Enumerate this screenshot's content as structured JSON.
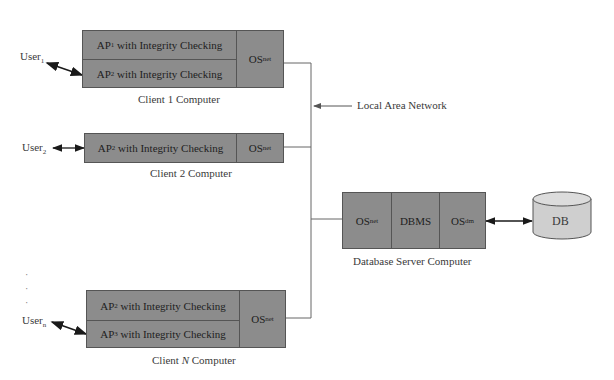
{
  "diagram": {
    "clients": [
      {
        "label": "Client 1 Computer",
        "user": {
          "base": "User",
          "sub": "1"
        },
        "apps": [
          {
            "base": "AP",
            "sub": "1",
            "text": " with Integrity Checking"
          },
          {
            "base": "AP",
            "sub": "2",
            "text": " with Integrity Checking"
          }
        ],
        "os": {
          "base": "OS",
          "sub": "net"
        }
      },
      {
        "label": "Client 2 Computer",
        "user": {
          "base": "User",
          "sub": "2"
        },
        "apps": [
          {
            "base": "AP",
            "sub": "2",
            "text": " with Integrity Checking"
          }
        ],
        "os": {
          "base": "OS",
          "sub": "net"
        }
      },
      {
        "label_prefix": "Client ",
        "label_italic": "N",
        "label_suffix": " Computer",
        "user": {
          "base": "User",
          "sub": "n"
        },
        "apps": [
          {
            "base": "AP",
            "sub": "2",
            "text": " with Integrity Checking"
          },
          {
            "base": "AP",
            "sub": "3",
            "text": " with Integrity Checking"
          }
        ],
        "os": {
          "base": "OS",
          "sub": "net"
        }
      }
    ],
    "network_label": "Local Area Network",
    "server": {
      "label": "Database Server Computer",
      "components": [
        {
          "base": "OS",
          "sub": "net"
        },
        {
          "base": "DBMS",
          "sub": ""
        },
        {
          "base": "OS",
          "sub": "dm"
        }
      ]
    },
    "database": {
      "label": "DB"
    },
    "ellipsis": ".\n.\n."
  }
}
